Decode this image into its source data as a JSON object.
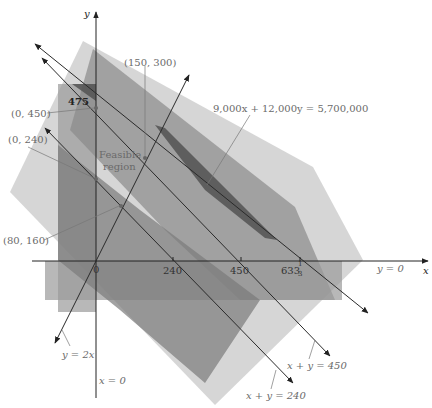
{
  "colors": {
    "background": "#ffffff",
    "light_shade": "#c8c8c8",
    "medium_shade": "#8a8a8a",
    "dark_shade": "#4d4d4d",
    "axis": "#222222",
    "label": "#6a6a6a"
  },
  "axes": {
    "x_label": "x",
    "y_label": "y",
    "x_axis_name": "y = 0",
    "y_axis_name": "x = 0",
    "origin_label": "0",
    "x_ticks": [
      "240",
      "450",
      "633",
      "1",
      "3"
    ],
    "y_tick": "475"
  },
  "lines": {
    "l240": "x + y = 240",
    "l450": "x + y = 450",
    "ly2x": "y = 2x",
    "lobj": "9,000x + 12,000y = 5,700,000"
  },
  "points": {
    "p0450": "(0, 450)",
    "p0240": "(0, 240)",
    "p80160": "(80, 160)",
    "p150300": "(150, 300)"
  },
  "region": {
    "line1": "Feasible",
    "line2": "region"
  }
}
